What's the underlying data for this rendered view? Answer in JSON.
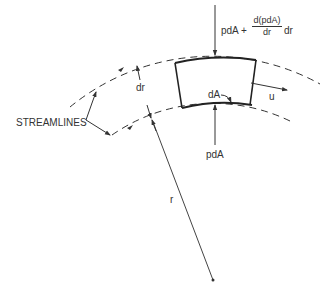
{
  "labels": {
    "top_force_prefix": "pdA +",
    "top_force_num": "d(pdA)",
    "top_force_den": "dr",
    "top_force_suffix": "dr",
    "bottom_force": "pdA",
    "area": "dA",
    "velocity": "u",
    "thickness": "dr",
    "radius": "r",
    "streamlines": "STREAMLINES"
  },
  "colors": {
    "line": "#333333",
    "background": "#ffffff"
  }
}
